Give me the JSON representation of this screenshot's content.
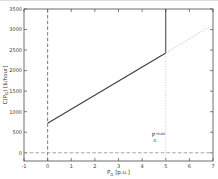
{
  "figure": {
    "background": "#ffffff"
  },
  "chart_data": {
    "type": "line",
    "title": "",
    "xlabel": {
      "base": "P",
      "sub": "G",
      "rest": " [p.u.]",
      "text": "P_G [p.u.]"
    },
    "ylabel": {
      "pre": "C(P",
      "sub": "G",
      "rest": ") [$/hour]",
      "text": "C(P_G) [$/hour]"
    },
    "xlim": [
      -1,
      7
    ],
    "ylim": [
      -200,
      3500
    ],
    "xticks": [
      -1,
      0,
      1,
      2,
      3,
      4,
      5,
      6,
      7
    ],
    "yticks": [
      0,
      500,
      1000,
      1500,
      2000,
      2500,
      3000,
      3500
    ],
    "grid": false,
    "legend": null,
    "axis_color": "#4a4a4a",
    "tick_label_color": "#3a3a3a",
    "annotation": {
      "base": "P",
      "sup": "max",
      "sub": "G",
      "x": 4.75,
      "y": 350,
      "text": "P_G^max"
    },
    "series": [
      {
        "name": "generator-cost-curve",
        "style": "solid",
        "color": "#3c3c3c",
        "width": 1.1,
        "points": [
          [
            0,
            720
          ],
          [
            5,
            2430
          ]
        ]
      },
      {
        "name": "cost-limit-vertical",
        "style": "solid",
        "color": "#3c3c3c",
        "width": 1.0,
        "points": [
          [
            5,
            2430
          ],
          [
            5,
            3500
          ]
        ]
      },
      {
        "name": "cost-curve-extension-dotted",
        "style": "dotted",
        "color": "#bdbdbd",
        "width": 1.0,
        "points": [
          [
            5,
            2430
          ],
          [
            7,
            3120
          ]
        ]
      },
      {
        "name": "x-zero-dashed",
        "style": "dashed",
        "color": "#6b6b6b",
        "width": 0.9,
        "points": [
          [
            0,
            -200
          ],
          [
            0,
            3500
          ]
        ]
      },
      {
        "name": "y-zero-dashed",
        "style": "dashed",
        "color": "#9a9a9a",
        "width": 0.9,
        "points": [
          [
            -1,
            0
          ],
          [
            7,
            0
          ]
        ]
      },
      {
        "name": "pgmax-vertical-dotted",
        "style": "dotted",
        "color": "#c4c4c4",
        "width": 0.9,
        "points": [
          [
            5,
            -200
          ],
          [
            5,
            2430
          ]
        ]
      }
    ]
  }
}
